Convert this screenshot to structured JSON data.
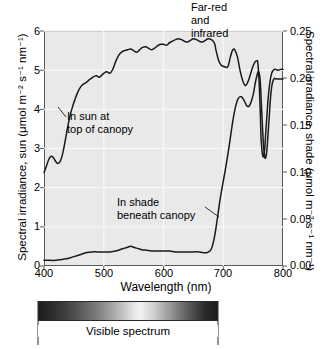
{
  "chart_data": {
    "type": "line",
    "title": "",
    "xlabel": "Wavelength (nm)",
    "ylabel_left": "Spectral irradiance, sun (μmol m⁻² s⁻¹ nm⁻¹)",
    "ylabel_right": "Spectral irradiance, shade (μmol m⁻² s⁻¹ nm⁻¹)",
    "xlim": [
      400,
      800
    ],
    "ylim_left": [
      0,
      6
    ],
    "ylim_right": [
      0.0,
      0.25
    ],
    "grid": true,
    "legend_position": "inline-annotations",
    "xticks": [
      "400",
      "500",
      "600",
      "700",
      "800"
    ],
    "xtick_values": [
      400,
      500,
      600,
      700,
      800
    ],
    "yticks_left": [
      "0",
      "1",
      "2",
      "3",
      "4",
      "5",
      "6"
    ],
    "ytick_values_left": [
      0,
      1,
      2,
      3,
      4,
      5,
      6
    ],
    "yticks_right": [
      "0.00",
      "0.05",
      "0.10",
      "0.15",
      "0.20",
      "0.25"
    ],
    "ytick_values_right": [
      0.0,
      0.05,
      0.1,
      0.15,
      0.2,
      0.25
    ],
    "series": [
      {
        "name": "In sun at top of canopy",
        "axis": "left",
        "x": [
          400,
          404,
          408,
          412,
          416,
          420,
          424,
          428,
          432,
          436,
          440,
          444,
          448,
          452,
          456,
          460,
          464,
          468,
          472,
          476,
          480,
          484,
          488,
          492,
          496,
          500,
          505,
          510,
          515,
          520,
          525,
          530,
          535,
          540,
          545,
          550,
          555,
          560,
          565,
          570,
          575,
          580,
          585,
          590,
          595,
          600,
          605,
          610,
          615,
          620,
          625,
          630,
          635,
          640,
          645,
          650,
          655,
          660,
          665,
          670,
          675,
          680,
          685,
          688,
          692,
          696,
          700,
          704,
          708,
          712,
          716,
          720,
          724,
          728,
          732,
          736,
          740,
          744,
          748,
          752,
          756,
          758,
          760,
          762,
          764,
          768,
          772,
          776,
          780,
          784,
          788,
          792,
          796,
          800
        ],
        "y": [
          2.38,
          2.55,
          2.72,
          2.8,
          2.76,
          2.66,
          2.62,
          2.7,
          2.92,
          3.24,
          3.58,
          3.86,
          4.08,
          4.26,
          4.42,
          4.54,
          4.62,
          4.66,
          4.7,
          4.76,
          4.8,
          4.84,
          4.86,
          4.82,
          4.86,
          4.92,
          4.96,
          4.92,
          5.02,
          5.22,
          5.38,
          5.46,
          5.5,
          5.52,
          5.54,
          5.5,
          5.46,
          5.52,
          5.58,
          5.6,
          5.56,
          5.52,
          5.56,
          5.62,
          5.66,
          5.66,
          5.64,
          5.7,
          5.74,
          5.78,
          5.8,
          5.78,
          5.74,
          5.72,
          5.76,
          5.8,
          5.78,
          5.74,
          5.72,
          5.76,
          5.8,
          5.78,
          5.7,
          5.5,
          5.26,
          5.14,
          5.1,
          5.08,
          5.1,
          5.34,
          5.52,
          5.5,
          5.32,
          5.0,
          4.76,
          4.62,
          4.66,
          4.82,
          5.02,
          5.18,
          5.24,
          5.16,
          4.7,
          3.9,
          3.1,
          2.82,
          3.6,
          4.42,
          4.86,
          5.0,
          5.02,
          5.0,
          5.02,
          5.02
        ],
        "color": "#1a1a1a"
      },
      {
        "name": "In shade beneath canopy",
        "axis": "right",
        "x": [
          400,
          410,
          420,
          430,
          440,
          450,
          460,
          470,
          480,
          490,
          500,
          510,
          520,
          530,
          535,
          540,
          545,
          550,
          555,
          560,
          565,
          570,
          580,
          590,
          600,
          610,
          620,
          630,
          640,
          650,
          660,
          670,
          675,
          680,
          685,
          690,
          695,
          700,
          705,
          710,
          715,
          720,
          725,
          730,
          735,
          740,
          745,
          750,
          754,
          758,
          760,
          762,
          764,
          768,
          772,
          776,
          780,
          784,
          788,
          792,
          796,
          800
        ],
        "y": [
          0.006,
          0.006,
          0.006,
          0.007,
          0.008,
          0.01,
          0.012,
          0.014,
          0.015,
          0.015,
          0.015,
          0.015,
          0.016,
          0.018,
          0.019,
          0.02,
          0.021,
          0.02,
          0.019,
          0.018,
          0.017,
          0.017,
          0.016,
          0.016,
          0.016,
          0.016,
          0.015,
          0.015,
          0.015,
          0.015,
          0.015,
          0.014,
          0.015,
          0.018,
          0.03,
          0.05,
          0.072,
          0.09,
          0.108,
          0.128,
          0.15,
          0.168,
          0.178,
          0.18,
          0.176,
          0.17,
          0.172,
          0.182,
          0.196,
          0.206,
          0.205,
          0.196,
          0.17,
          0.124,
          0.118,
          0.15,
          0.185,
          0.198,
          0.199,
          0.199,
          0.199,
          0.199
        ],
        "color": "#1a1a1a"
      }
    ],
    "annotations": [
      {
        "name": "far-red-and-infrared",
        "text_lines": [
          "Far-red",
          "and",
          "infrared"
        ],
        "x": 733,
        "y_note": "above plot top"
      },
      {
        "name": "in-sun-at-top-of-canopy",
        "text_lines": [
          "In sun at",
          "top of canopy"
        ],
        "points_to_x": 440,
        "points_to_y_left": 3.95
      },
      {
        "name": "in-shade-beneath-canopy",
        "text_lines": [
          "In shade",
          "beneath canopy"
        ],
        "points_to_x": 690,
        "points_to_y_right": 0.048
      }
    ]
  },
  "labels": {
    "x_axis_title": "Wavelength (nm)",
    "y_left_title": "Spectral irradiance, sun (μmol m⁻² s⁻¹ nm⁻¹)",
    "y_right_title": "Spectral irradiance, shade (μmol m⁻² s⁻¹ nm⁻¹)",
    "annot_farred_line1": "Far-red",
    "annot_farred_line2": "and",
    "annot_farred_line3": "infrared",
    "annot_sun_line1": "In sun at",
    "annot_sun_line2": "top of canopy",
    "annot_shade_line1": "In shade",
    "annot_shade_line2": "beneath canopy",
    "spectrum_caption": "Visible spectrum"
  },
  "ticks": {
    "x": [
      "400",
      "500",
      "600",
      "700",
      "800"
    ],
    "y_left": [
      "6",
      "5",
      "4",
      "3",
      "2",
      "1",
      "0"
    ],
    "y_right": [
      "0.25",
      "0.20",
      "0.15",
      "0.10",
      "0.05",
      "0.00"
    ]
  },
  "colors": {
    "plot_background": "#e9e9e9",
    "curve": "#1a1a1a",
    "axis": "#5a5a5a",
    "gridline": "#f7f7f7",
    "text": "#000000"
  }
}
